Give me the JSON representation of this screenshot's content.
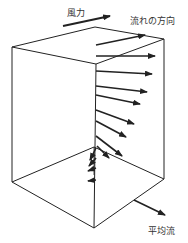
{
  "labels": {
    "wind": "風力",
    "flow_direction": "流れの方向",
    "mean_flow": "平均流"
  },
  "colors": {
    "line": "#222222",
    "text": "#333333",
    "background": "#ffffff"
  },
  "box": {
    "top": [
      [
        12,
        47
      ],
      [
        95,
        27
      ],
      [
        164,
        39
      ],
      [
        96,
        64
      ]
    ],
    "bottom": [
      [
        12,
        182
      ],
      [
        94,
        147
      ],
      [
        164,
        179
      ],
      [
        94,
        228
      ]
    ]
  }
}
